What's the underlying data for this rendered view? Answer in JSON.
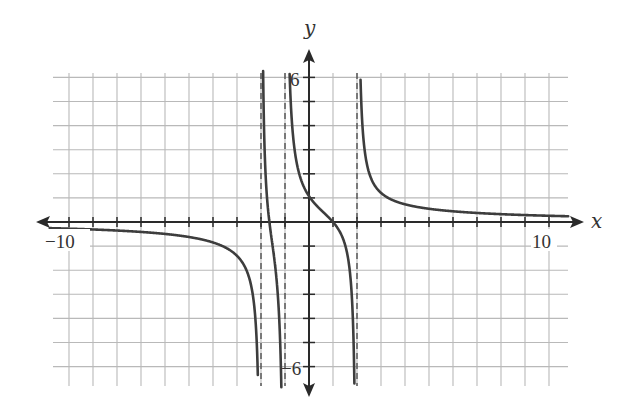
{
  "chart_data": {
    "type": "line",
    "title": "",
    "xlabel": "x",
    "ylabel": "y",
    "xlim": [
      -10.8,
      10.8
    ],
    "ylim": [
      -6.8,
      6.8
    ],
    "grid": true,
    "x_tick_labels": [
      {
        "value": -10,
        "text": "−10"
      },
      {
        "value": 10,
        "text": "10"
      }
    ],
    "y_tick_labels": [
      {
        "value": 6,
        "text": "6"
      },
      {
        "value": -6,
        "text": "−6"
      }
    ],
    "vertical_asymptotes": [
      -2,
      -1,
      2
    ],
    "horizontal_asymptote": 0,
    "intercepts": {
      "y_intercept": [
        0,
        1
      ],
      "x_intercepts": [
        [
          -1.65,
          0
        ],
        [
          1,
          0
        ]
      ]
    },
    "series": [
      {
        "name": "f(x)",
        "formula": "2.6(x-1)(x+1.65)/((x+2)(x+1)(x-2))",
        "branches": [
          {
            "x": [
              -10,
              -8,
              -6,
              -4,
              -3,
              -2.5,
              -2.2
            ],
            "y": [
              -0.28,
              -0.35,
              -0.48,
              -0.85,
              -1.4,
              -2.6,
              -5.9
            ]
          },
          {
            "x": [
              -1.88,
              -1.8,
              -1.65,
              -1.5,
              -1.35,
              -1.2
            ],
            "y": [
              6.0,
              3.4,
              0,
              -1.5,
              -3.0,
              -6.5
            ]
          },
          {
            "x": [
              -0.78,
              -0.5,
              0,
              0.5,
              1,
              1.5,
              1.85
            ],
            "y": [
              6.3,
              2.5,
              1.07,
              0.55,
              0,
              -1.2,
              -6.3
            ]
          },
          {
            "x": [
              2.25,
              2.5,
              3,
              4,
              6,
              8,
              10
            ],
            "y": [
              6.4,
              3.0,
              1.21,
              0.72,
              0.42,
              0.31,
              0.26
            ]
          }
        ]
      }
    ]
  },
  "labels": {
    "x_axis": "x",
    "y_axis": "y",
    "x_min": "−10",
    "x_max": "10",
    "y_max": "6",
    "y_min": "−6"
  },
  "colors": {
    "curve": "#3d3d3d",
    "grid": "#b9b9b9",
    "axis": "#2a2a2a",
    "background": "#ffffff"
  }
}
